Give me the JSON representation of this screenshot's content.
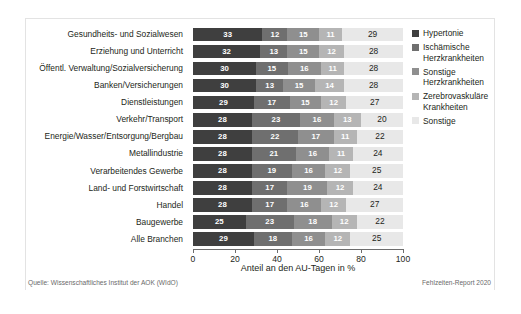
{
  "chart_data": {
    "type": "bar",
    "orientation": "horizontal",
    "stacked": true,
    "stacked_mode": "absolute",
    "title": "",
    "subtitle": "",
    "xlabel": "Anteil an den AU-Tagen in %",
    "ylabel": "",
    "xlim": [
      0,
      100
    ],
    "xticks": [
      0,
      20,
      40,
      60,
      80,
      100
    ],
    "xtick_labels": [
      "0",
      "20",
      "40",
      "60",
      "80",
      "100"
    ],
    "grid": false,
    "legend_position": "right",
    "categories": [
      "Gesundheits- und Sozialwesen",
      "Erziehung und Unterricht",
      "Öffentl. Verwaltung/Sozialversicherung",
      "Banken/Versicherungen",
      "Dienstleistungen",
      "Verkehr/Transport",
      "Energie/Wasser/Entsorgung/Bergbau",
      "Metallindustrie",
      "Verarbeitendes Gewerbe",
      "Land- und Forstwirtschaft",
      "Handel",
      "Baugewerbe",
      "Alle Branchen"
    ],
    "series": [
      {
        "name": "Hypertonie",
        "color": "#3f3f3f",
        "values": [
          33,
          32,
          30,
          30,
          29,
          28,
          28,
          28,
          28,
          28,
          28,
          25,
          29
        ]
      },
      {
        "name": "Ischämische Herzkrankheiten",
        "color": "#6f6f6f",
        "values": [
          12,
          13,
          15,
          13,
          17,
          23,
          22,
          21,
          19,
          17,
          17,
          23,
          18
        ]
      },
      {
        "name": "Sonstige Herzkrankheiten",
        "color": "#8f8f8f",
        "values": [
          15,
          15,
          16,
          15,
          15,
          16,
          17,
          16,
          16,
          19,
          16,
          18,
          16
        ]
      },
      {
        "name": "Zerebrovaskuläre Krankheiten",
        "color": "#b5b5b5",
        "values": [
          11,
          12,
          11,
          14,
          12,
          13,
          11,
          11,
          12,
          12,
          12,
          12,
          12
        ]
      },
      {
        "name": "Sonstige",
        "color": "#e8e8e8",
        "values": [
          29,
          28,
          28,
          28,
          27,
          20,
          22,
          24,
          25,
          24,
          27,
          22,
          25
        ]
      }
    ]
  },
  "legend": {
    "items": [
      {
        "label": "Hypertonie"
      },
      {
        "label": "Ischämische Herzkrankheiten"
      },
      {
        "label": "Sonstige Herzkrankheiten"
      },
      {
        "label": "Zerebrovaskuläre Krankheiten"
      },
      {
        "label": "Sonstige"
      }
    ]
  },
  "footer": {
    "source": "Quelle: Wissenschaftliches Institut der AOK (WIdO)",
    "report": "Fehlzeiten-Report 2020"
  }
}
